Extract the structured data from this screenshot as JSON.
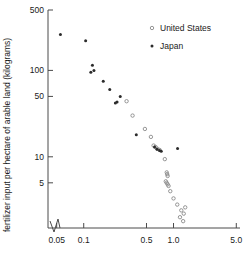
{
  "chart_data": {
    "type": "scatter",
    "title": "",
    "xlabel": "fertilizer per hectare (kilograms)",
    "ylabel": "fertilizer input per hectare of arable land (kilograms)",
    "xscale": "log",
    "yscale": "log",
    "xlim": [
      0.04,
      5.5
    ],
    "ylim": [
      1.5,
      500
    ],
    "grid": false,
    "axis_break": true,
    "legend_position": "top-right",
    "xticks": [
      {
        "value": 0.05,
        "label": "0.05"
      },
      {
        "value": 0.1,
        "label": "0.1"
      },
      {
        "value": 0.5,
        "label": "0.5"
      },
      {
        "value": 1.0,
        "label": "1.0"
      },
      {
        "value": 5.0,
        "label": "5.0"
      }
    ],
    "yticks": [
      {
        "value": 500,
        "label": "500"
      },
      {
        "value": 100,
        "label": "100"
      },
      {
        "value": 50,
        "label": "50"
      },
      {
        "value": 10,
        "label": "10"
      },
      {
        "value": 5,
        "label": "5"
      }
    ],
    "series": [
      {
        "name": "United States",
        "marker": "open-circle",
        "color": "#8a8a8a",
        "points": [
          [
            0.3,
            44
          ],
          [
            0.35,
            30
          ],
          [
            0.48,
            21
          ],
          [
            0.56,
            17
          ],
          [
            0.6,
            13.5
          ],
          [
            0.63,
            13.0
          ],
          [
            0.66,
            12.4
          ],
          [
            0.7,
            12.0
          ],
          [
            0.8,
            9.4
          ],
          [
            0.84,
            6.6
          ],
          [
            0.85,
            6.3
          ],
          [
            0.86,
            6.0
          ],
          [
            0.82,
            5.2
          ],
          [
            0.84,
            5.0
          ],
          [
            0.86,
            4.8
          ],
          [
            0.88,
            4.6
          ],
          [
            0.92,
            4.0
          ],
          [
            1.0,
            3.3
          ],
          [
            1.1,
            2.8
          ],
          [
            1.22,
            2.4
          ],
          [
            1.3,
            2.2
          ],
          [
            1.35,
            2.6
          ],
          [
            1.18,
            2.0
          ],
          [
            1.28,
            1.8
          ]
        ]
      },
      {
        "name": "Japan",
        "marker": "filled-circle",
        "color": "#2b2b2b",
        "points": [
          [
            0.055,
            260
          ],
          [
            0.105,
            220
          ],
          [
            0.125,
            115
          ],
          [
            0.13,
            100
          ],
          [
            0.12,
            95
          ],
          [
            0.165,
            75
          ],
          [
            0.195,
            60
          ],
          [
            0.255,
            50
          ],
          [
            0.235,
            43
          ],
          [
            0.225,
            42
          ],
          [
            0.385,
            18
          ],
          [
            0.615,
            13.0
          ],
          [
            0.655,
            12.2
          ],
          [
            0.7,
            11.8
          ],
          [
            0.73,
            11.6
          ],
          [
            1.11,
            12.5
          ]
        ]
      }
    ]
  },
  "legend": {
    "entries": [
      {
        "label": "United States",
        "marker": "open-circle"
      },
      {
        "label": "Japan",
        "marker": "filled-circle"
      }
    ]
  }
}
